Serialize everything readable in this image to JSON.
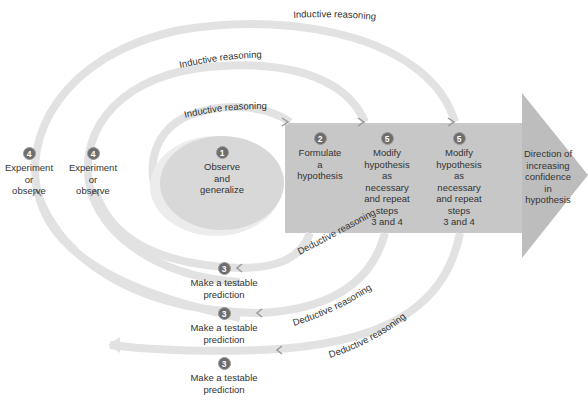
{
  "diagram": {
    "colors": {
      "arrow_fill": "#b9b9b9",
      "arrow_body": "#c4c4c4",
      "ellipse_fill": "#d6d6d6",
      "arc_stroke": "#e3e3e3",
      "badge_fill": "#6d6d6d",
      "text": "#333333"
    },
    "inductive_labels": [
      "Inductive reasoning",
      "Inductive reasoning",
      "Inductive reasoning"
    ],
    "deductive_labels": [
      "Deductive reasoning",
      "Deductive reasoning",
      "Deductive reasoning"
    ],
    "steps": {
      "observe": {
        "number": "1",
        "lines": [
          "Observe",
          "and",
          "generalize"
        ]
      },
      "formulate": {
        "number": "2",
        "lines": [
          "Formulate",
          "a",
          "hypothesis"
        ]
      },
      "modify_1": {
        "number": "5",
        "lines": [
          "Modify",
          "hypothesis",
          "as",
          "necessary",
          "and repeat",
          "steps",
          "3 and 4"
        ]
      },
      "modify_2": {
        "number": "5",
        "lines": [
          "Modify",
          "hypothesis",
          "as",
          "necessary",
          "and repeat",
          "steps",
          "3 and 4"
        ]
      },
      "experiment_outer": {
        "number": "4",
        "lines": [
          "Experiment",
          "or",
          "observe"
        ]
      },
      "experiment_inner": {
        "number": "4",
        "lines": [
          "Experiment",
          "or",
          "observe"
        ]
      },
      "predict_1": {
        "number": "3",
        "lines": [
          "Make a testable",
          "prediction"
        ]
      },
      "predict_2": {
        "number": "3",
        "lines": [
          "Make a testable",
          "prediction"
        ]
      },
      "predict_3": {
        "number": "3",
        "lines": [
          "Make a testable",
          "prediction"
        ]
      }
    },
    "direction": {
      "lines": [
        "Direction of",
        "increasing",
        "confidence",
        "in",
        "hypothesis"
      ]
    }
  }
}
